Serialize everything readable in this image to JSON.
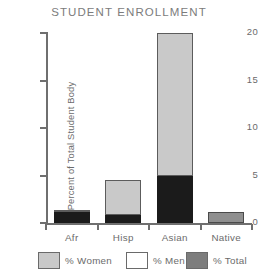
{
  "chart_data": {
    "type": "bar",
    "title": "STUDENT ENROLLMENT",
    "xlabel": "",
    "ylabel": "Percent of Total Student Body",
    "ylim": [
      0,
      20
    ],
    "yticks": [
      0,
      5,
      10,
      15,
      20
    ],
    "ytick_labels": [
      "0",
      "5",
      "10",
      "15",
      "20"
    ],
    "grid": false,
    "stacked": true,
    "legend_position": "bottom",
    "categories": [
      "Afr",
      "Hisp",
      "Asian",
      "Native"
    ],
    "series": [
      {
        "name": "% Women",
        "values": [
          1.4,
          4.5,
          20.0,
          1.2
        ]
      },
      {
        "name": "% Men",
        "values": [
          0,
          0,
          0,
          0
        ]
      },
      {
        "name": "% Total",
        "values": [
          1.2,
          0.8,
          5.0,
          0
        ]
      }
    ],
    "bars": [
      {
        "category": "Afr",
        "total": 1.4,
        "segments": [
          {
            "series": "% Women",
            "from": 1.2,
            "to": 1.4,
            "fill": "#c9c9c9"
          },
          {
            "series": "% Total",
            "from": 0.0,
            "to": 1.2,
            "fill": "#1b1b1b"
          }
        ]
      },
      {
        "category": "Hisp",
        "total": 4.5,
        "segments": [
          {
            "series": "% Women",
            "from": 0.8,
            "to": 4.5,
            "fill": "#c9c9c9"
          },
          {
            "series": "% Total",
            "from": 0.0,
            "to": 0.8,
            "fill": "#1b1b1b"
          }
        ]
      },
      {
        "category": "Asian",
        "total": 20.0,
        "segments": [
          {
            "series": "% Women",
            "from": 5.0,
            "to": 20.0,
            "fill": "#c9c9c9"
          },
          {
            "series": "% Total",
            "from": 0.0,
            "to": 5.0,
            "fill": "#1b1b1b"
          }
        ]
      },
      {
        "category": "Native",
        "total": 1.2,
        "segments": [
          {
            "series": "% Women",
            "from": 0.0,
            "to": 1.2,
            "fill": "#8f8f8f"
          }
        ]
      }
    ],
    "legend": [
      {
        "label": "% Women",
        "color": "#c9c9c9"
      },
      {
        "label": "% Men",
        "color": "#ffffff"
      },
      {
        "label": "% Total",
        "color": "#7d7d7d"
      }
    ],
    "colors": {
      "women": "#c9c9c9",
      "men": "#ffffff",
      "total": "#1b1b1b",
      "native": "#8f8f8f",
      "axis": "#6f6f6f",
      "text": "#6b6b6b",
      "title": "#7c7c7c"
    }
  }
}
